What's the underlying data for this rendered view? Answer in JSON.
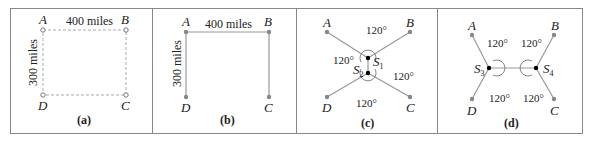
{
  "figure": {
    "panels": [
      {
        "caption": "(a)",
        "labels": {
          "A": "A",
          "B": "B",
          "C": "C",
          "D": "D"
        },
        "horizontal_distance": "400 miles",
        "vertical_distance": "300 miles",
        "style": "dashed rectangle with open circle nodes"
      },
      {
        "caption": "(b)",
        "labels": {
          "A": "A",
          "B": "B",
          "C": "C",
          "D": "D"
        },
        "horizontal_distance": "400 miles",
        "vertical_distance": "300 miles",
        "style": "solid path D-A-B-C with filled nodes"
      },
      {
        "caption": "(c)",
        "labels": {
          "A": "A",
          "B": "B",
          "C": "C",
          "D": "D"
        },
        "steiner_points": [
          {
            "name": "S",
            "sub": "1"
          },
          {
            "name": "S",
            "sub": "2"
          }
        ],
        "angles": [
          "120°",
          "120°",
          "120°",
          "120°"
        ]
      },
      {
        "caption": "(d)",
        "labels": {
          "A": "A",
          "B": "B",
          "C": "C",
          "D": "D"
        },
        "steiner_points": [
          {
            "name": "S",
            "sub": "3"
          },
          {
            "name": "S",
            "sub": "4"
          }
        ],
        "angles": [
          "120°",
          "120°",
          "120°",
          "120°"
        ]
      }
    ],
    "colors": {
      "line": "#999999",
      "node": "#8a8a8a",
      "steiner": "#000000",
      "frame": "#888888"
    }
  }
}
